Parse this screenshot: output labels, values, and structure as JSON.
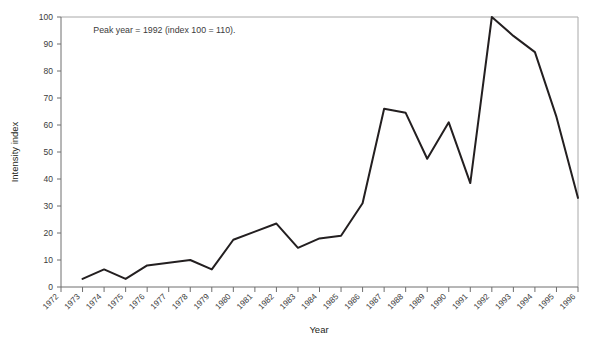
{
  "chart_data": {
    "type": "line",
    "title": "",
    "xlabel": "Year",
    "ylabel": "Intensity index",
    "x": [
      1972,
      1973,
      1974,
      1975,
      1976,
      1977,
      1978,
      1979,
      1980,
      1981,
      1982,
      1983,
      1984,
      1985,
      1986,
      1987,
      1988,
      1989,
      1990,
      1991,
      1992,
      1993,
      1994,
      1995,
      1996
    ],
    "categories": [
      "1972",
      "1973",
      "1974",
      "1975",
      "1976",
      "1977",
      "1978",
      "1979",
      "1980",
      "1981",
      "1982",
      "1983",
      "1984",
      "1985",
      "1986",
      "1987",
      "1988",
      "1989",
      "1990",
      "1991",
      "1992",
      "1993",
      "1994",
      "1995",
      "1996"
    ],
    "values": [
      null,
      3,
      6.5,
      3,
      8,
      9,
      10,
      6.5,
      17.5,
      20.5,
      23.5,
      14.5,
      18,
      19,
      31,
      66,
      64.5,
      47.5,
      61,
      38.5,
      100,
      93,
      87,
      63,
      33
    ],
    "series": [
      {
        "name": "Intensity index",
        "color": "#231f20",
        "values": [
          null,
          3,
          6.5,
          3,
          8,
          9,
          10,
          6.5,
          17.5,
          20.5,
          23.5,
          14.5,
          18,
          19,
          31,
          66,
          64.5,
          47.5,
          61,
          38.5,
          100,
          93,
          87,
          63,
          33
        ]
      }
    ],
    "ylim": [
      0,
      100
    ],
    "yticks": [
      0,
      10,
      20,
      30,
      40,
      50,
      60,
      70,
      80,
      90,
      100
    ],
    "ytick_labels": [
      "0",
      "10",
      "20",
      "30",
      "40",
      "50",
      "60",
      "70",
      "80",
      "90",
      "100"
    ],
    "xlim": [
      1972,
      1996
    ],
    "grid": false,
    "legend": null,
    "annotations": [
      {
        "text": "Peak year = 1992 (index 100 = 110).",
        "x": 1973.5,
        "y": 94
      }
    ]
  }
}
